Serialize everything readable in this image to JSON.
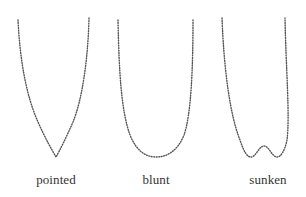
{
  "figure": {
    "shapes": [
      {
        "id": "pointed",
        "label": "pointed",
        "label_x": 56,
        "path": "M18,20 C20,60 26,95 38,122 C45,138 52,150 56,157 C60,150 66,138 73,122 C82,100 88,60 89,18"
      },
      {
        "id": "blunt",
        "label": "blunt",
        "label_x": 156,
        "path": "M118,20 C119,70 121,110 130,135 C136,150 145,157 156,157 C168,157 178,150 184,135 C191,115 193,70 193,20"
      },
      {
        "id": "sunken",
        "label": "sunken",
        "label_x": 268,
        "path": "M222,18 C224,70 230,115 240,140 C244,152 247,157 251,157 C256,157 259,146 264,146 C269,146 272,157 277,157 C281,157 285,150 287,140 C290,115 286,70 285,18"
      }
    ],
    "stroke_color": "#555555",
    "background": "#ffffff"
  }
}
